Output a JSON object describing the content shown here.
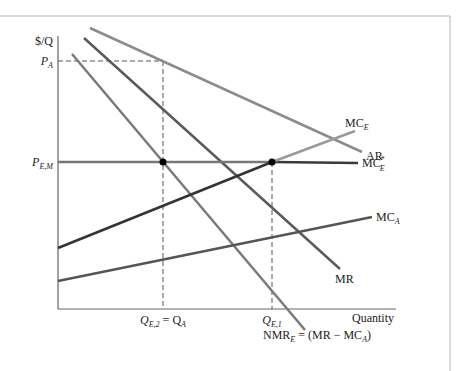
{
  "figure": {
    "axes": {
      "y_label": "$/Q",
      "x_label": "Quantity"
    },
    "price_labels": {
      "p_a": {
        "main": "P",
        "sub": "A"
      },
      "p_em": {
        "main": "P",
        "sub": "E,M"
      }
    },
    "quantity_labels": {
      "q_e2": {
        "main": "Q",
        "sub": "E,2",
        "eq": " = Q",
        "sub2": "A"
      },
      "q_e1": {
        "main": "Q",
        "sub": "E,1"
      }
    },
    "curves": {
      "ar": {
        "label": "AR",
        "color": "#8c8c8c"
      },
      "mr": {
        "label": "MR",
        "color": "#5a5a5a"
      },
      "nmr": {
        "main": "NMR",
        "sub": "E",
        "rest": " = (MR − MC",
        "sub2": "A",
        "close": ")",
        "color": "#7a7a7a"
      },
      "mc_e": {
        "main": "MC",
        "sub": "E",
        "color_low": "#333333",
        "color_high": "#9a9a9a"
      },
      "mc_e_star": {
        "main": "MC",
        "sup": "*",
        "sub": "E",
        "color": "#3a3a3a"
      },
      "mc_a": {
        "main": "MC",
        "sub": "A",
        "color": "#555555"
      }
    },
    "equilibrium_points": [
      {
        "name": "domestic-equilibrium",
        "at": "Q_E,2 = Q_A"
      },
      {
        "name": "export-equilibrium",
        "at": "Q_E,1"
      }
    ]
  }
}
